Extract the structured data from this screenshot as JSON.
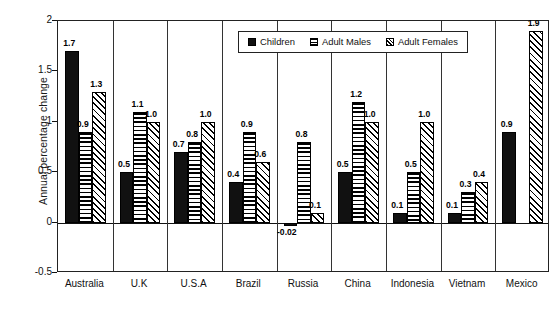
{
  "chart_data": {
    "type": "bar",
    "title": "",
    "subtitle": "",
    "xlabel": "",
    "ylabel": "Annual percentage change",
    "ylim": [
      -0.5,
      2
    ],
    "yticks": [
      2,
      1.5,
      1,
      0.5,
      0,
      -0.5
    ],
    "ytick_labels": [
      "2",
      "1.5",
      "1",
      "0.5",
      "0",
      "-0.5"
    ],
    "grid": false,
    "legend_position": "top-center-inside",
    "categories": [
      "Australia",
      "U.K",
      "U.S.A",
      "Brazil",
      "Russia",
      "China",
      "Indonesia",
      "Vietnam",
      "Mexico"
    ],
    "series": [
      {
        "name": "Children",
        "pattern": "solid-black",
        "values": [
          1.7,
          0.5,
          0.7,
          0.4,
          -0.02,
          0.5,
          0.1,
          0.1,
          0.9
        ],
        "labels": [
          "1.7",
          "0.5",
          "0.7",
          "0.4",
          "-0.02",
          "0.5",
          "0.1",
          "0.1",
          "0.9"
        ]
      },
      {
        "name": "Adult Males",
        "pattern": "horizontal-stripes",
        "values": [
          0.9,
          1.1,
          0.8,
          0.9,
          0.8,
          1.2,
          0.5,
          0.3,
          null
        ],
        "labels": [
          "0.9",
          "1.1",
          "0.8",
          "0.9",
          "0.8",
          "1.2",
          "0.5",
          "0.3",
          ""
        ]
      },
      {
        "name": "Adult Females",
        "pattern": "diagonal-hatch",
        "values": [
          1.3,
          1.0,
          1.0,
          0.6,
          0.1,
          1.0,
          1.0,
          0.4,
          1.9
        ],
        "labels": [
          "1.3",
          "1.0",
          "1.0",
          "0.6",
          "0.1",
          "1.0",
          "1.0",
          "0.4",
          "1.9"
        ]
      }
    ]
  },
  "colors": {
    "children": "#111111",
    "axis": "#222222",
    "background": "#ffffff",
    "text": "#111111"
  }
}
